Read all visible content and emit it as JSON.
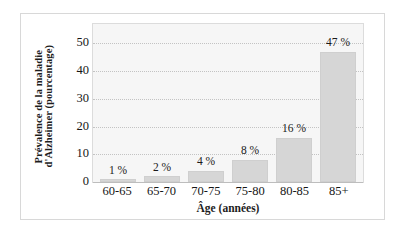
{
  "chart_data": {
    "type": "bar",
    "title": "",
    "xlabel": "Âge (années)",
    "ylabel_line1": "Prévalence de la maladie",
    "ylabel_line2": "d'Alzheimer (pourcentage)",
    "categories": [
      "60-65",
      "65-70",
      "70-75",
      "75-80",
      "80-85",
      "85+"
    ],
    "values": [
      1,
      2,
      4,
      8,
      16,
      47
    ],
    "point_labels": [
      "1 %",
      "2 %",
      "4 %",
      "8 %",
      "16 %",
      "47 %"
    ],
    "ylim": [
      0,
      57
    ],
    "yticks": [
      0,
      10,
      20,
      30,
      40,
      50
    ],
    "ytick_labels": [
      "0",
      "10",
      "20",
      "30",
      "40",
      "50"
    ],
    "grid": true,
    "grid_orientation": "horizontal",
    "legend": "none",
    "bar_color": "#d6d6d6",
    "bar_edge_color": "#cfcfcf",
    "plot_background": "#f6f6f6",
    "grid_color": "#c3c3c3",
    "text_color": "#161616",
    "frame_color": "#d8d8d8"
  }
}
